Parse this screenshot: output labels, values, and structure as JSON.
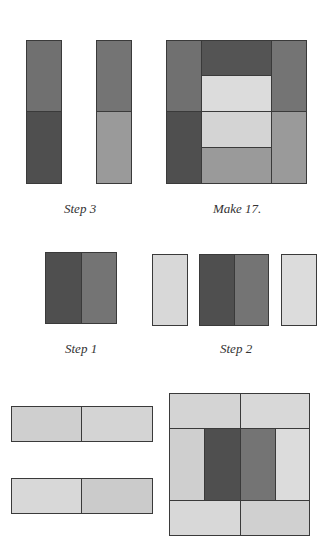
{
  "colors": {
    "dark": "#4f4f4f",
    "medium_dark": "#6f6f6f",
    "medium": "#747474",
    "medium_light": "#9a9a9a",
    "light": "#d8d8d8",
    "lighter": "#dcdcdc",
    "pale": "#cfcfcf",
    "outline": "#3a3a3a"
  },
  "captions": {
    "step3": "Step 3",
    "make": "Make 17.",
    "step1": "Step 1",
    "step2": "Step 2"
  },
  "diagram": {
    "step3": {
      "label": "Step 3",
      "units": [
        {
          "x": 26,
          "y": 40,
          "w": 36,
          "h": 72,
          "color": "#707070"
        },
        {
          "x": 26,
          "y": 111,
          "w": 36,
          "h": 73,
          "color": "#4f4f4f"
        },
        {
          "x": 96,
          "y": 40,
          "w": 36,
          "h": 72,
          "color": "#747474"
        },
        {
          "x": 96,
          "y": 111,
          "w": 36,
          "h": 73,
          "color": "#9a9a9a"
        }
      ]
    },
    "make17": {
      "label": "Make 17.",
      "units": [
        {
          "x": 166,
          "y": 40,
          "w": 36,
          "h": 72,
          "color": "#707070"
        },
        {
          "x": 166,
          "y": 111,
          "w": 36,
          "h": 73,
          "color": "#4f4f4f"
        },
        {
          "x": 201,
          "y": 40,
          "w": 71,
          "h": 36,
          "color": "#545454"
        },
        {
          "x": 201,
          "y": 75,
          "w": 71,
          "h": 37,
          "color": "#dcdcdc"
        },
        {
          "x": 201,
          "y": 111,
          "w": 71,
          "h": 37,
          "color": "#d4d4d4"
        },
        {
          "x": 201,
          "y": 147,
          "w": 71,
          "h": 37,
          "color": "#9a9a9a"
        },
        {
          "x": 271,
          "y": 40,
          "w": 36,
          "h": 72,
          "color": "#747474"
        },
        {
          "x": 271,
          "y": 111,
          "w": 36,
          "h": 73,
          "color": "#9a9a9a"
        }
      ]
    },
    "step1": {
      "label": "Step 1",
      "units": [
        {
          "x": 45,
          "y": 252,
          "w": 37,
          "h": 72,
          "color": "#4f4f4f"
        },
        {
          "x": 81,
          "y": 252,
          "w": 36,
          "h": 72,
          "color": "#747474"
        }
      ]
    },
    "step2": {
      "label": "Step 2",
      "units": [
        {
          "x": 152,
          "y": 254,
          "w": 36,
          "h": 72,
          "color": "#d8d8d8"
        },
        {
          "x": 199,
          "y": 254,
          "w": 36,
          "h": 72,
          "color": "#4f4f4f"
        },
        {
          "x": 234,
          "y": 254,
          "w": 35,
          "h": 72,
          "color": "#747474"
        },
        {
          "x": 281,
          "y": 254,
          "w": 36,
          "h": 72,
          "color": "#dcdcdc"
        }
      ]
    },
    "strips": {
      "units": [
        {
          "x": 11,
          "y": 406,
          "w": 71,
          "h": 36,
          "color": "#cfcfcf"
        },
        {
          "x": 81,
          "y": 406,
          "w": 72,
          "h": 36,
          "color": "#d4d4d4"
        },
        {
          "x": 11,
          "y": 478,
          "w": 71,
          "h": 36,
          "color": "#d8d8d8"
        },
        {
          "x": 81,
          "y": 478,
          "w": 72,
          "h": 36,
          "color": "#cbcbcb"
        }
      ]
    },
    "finished_block": {
      "units": [
        {
          "x": 169,
          "y": 393,
          "w": 72,
          "h": 36,
          "color": "#d4d4d4"
        },
        {
          "x": 240,
          "y": 393,
          "w": 70,
          "h": 36,
          "color": "#d8d8d8"
        },
        {
          "x": 169,
          "y": 428,
          "w": 36,
          "h": 73,
          "color": "#cfcfcf"
        },
        {
          "x": 204,
          "y": 428,
          "w": 37,
          "h": 73,
          "color": "#4f4f4f"
        },
        {
          "x": 240,
          "y": 428,
          "w": 36,
          "h": 73,
          "color": "#747474"
        },
        {
          "x": 275,
          "y": 428,
          "w": 35,
          "h": 73,
          "color": "#dcdcdc"
        },
        {
          "x": 169,
          "y": 500,
          "w": 72,
          "h": 36,
          "color": "#d8d8d8"
        },
        {
          "x": 240,
          "y": 500,
          "w": 70,
          "h": 36,
          "color": "#d0d0d0"
        }
      ]
    }
  }
}
